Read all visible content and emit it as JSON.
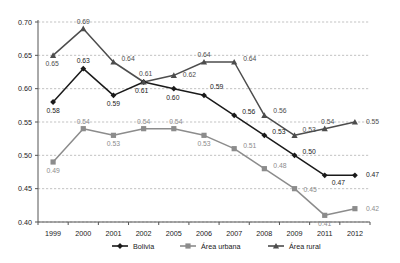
{
  "chart_data": {
    "type": "line",
    "title": "",
    "xlabel": "",
    "ylabel": "",
    "categories": [
      "1999",
      "2000",
      "2001",
      "2002",
      "2005",
      "2006",
      "2007",
      "2008",
      "2009",
      "2011",
      "2012"
    ],
    "ylim": [
      0.4,
      0.7
    ],
    "ytick_labels": [
      "0.70",
      "0.65",
      "0.60",
      "0.55",
      "0.50",
      "0.45",
      "0.40"
    ],
    "ytick_values": [
      0.7,
      0.65,
      0.6,
      0.55,
      0.5,
      0.45,
      0.4
    ],
    "grid": true,
    "legend_position": "bottom",
    "series": [
      {
        "name": "Bolivia",
        "color": "#1a1a1a",
        "marker": "diamond",
        "values": [
          0.58,
          0.63,
          0.59,
          0.61,
          0.6,
          0.59,
          0.56,
          0.53,
          0.5,
          0.47,
          0.47
        ],
        "labels": [
          "0.58",
          "0.63",
          "0.59",
          "0.61",
          "0.60",
          "0.59",
          "0.56",
          "0.53",
          "0.50",
          "0.47",
          "0.47"
        ]
      },
      {
        "name": "Área urbana",
        "color": "#8c8c8c",
        "marker": "square",
        "values": [
          0.49,
          0.54,
          0.53,
          0.54,
          0.54,
          0.53,
          0.51,
          0.48,
          0.45,
          0.41,
          0.42
        ],
        "labels": [
          "0.49",
          "0.54",
          "0.53",
          "0.54",
          "0.54",
          "0.53",
          "0.51",
          "0.48",
          "0.45",
          "0.41",
          "0.42"
        ]
      },
      {
        "name": "Área rural",
        "color": "#4d4d4d",
        "marker": "triangle",
        "values": [
          0.65,
          0.69,
          0.64,
          0.61,
          0.62,
          0.64,
          0.64,
          0.56,
          0.53,
          0.54,
          0.55
        ],
        "labels": [
          "0.65",
          "0.69",
          "0.64",
          "0.61",
          "0.62",
          "0.64",
          "0.64",
          "0.56",
          "0.53",
          "0.54",
          "0.55"
        ]
      }
    ]
  },
  "legend": {
    "items": [
      {
        "label": "Bolivia",
        "color": "#1a1a1a",
        "marker": "diamond"
      },
      {
        "label": "Área urbana",
        "color": "#8c8c8c",
        "marker": "square"
      },
      {
        "label": "Área rural",
        "color": "#4d4d4d",
        "marker": "triangle"
      }
    ]
  }
}
